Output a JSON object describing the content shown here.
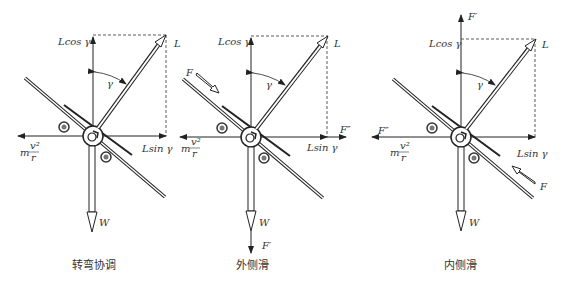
{
  "panels": [
    {
      "caption": "转弯协调",
      "labels": {
        "lcos": "Lcos γ",
        "l": "L",
        "gamma": "γ",
        "lsin": "Lsin γ",
        "mv_m": "m",
        "mv_num": "v²",
        "mv_den": "r",
        "w": "W"
      }
    },
    {
      "caption": "外侧滑",
      "labels": {
        "lcos": "Lcos γ",
        "l": "L",
        "gamma": "γ",
        "lsin": "Lsin γ",
        "mv_m": "m",
        "mv_num": "v²",
        "mv_den": "r",
        "w": "W",
        "f": "F",
        "f2": "F″",
        "f1": "F′"
      }
    },
    {
      "caption": "内侧滑",
      "labels": {
        "lcos": "Lcos γ",
        "l": "L",
        "gamma": "γ",
        "lsin": "Lsin γ",
        "mv_m": "m",
        "mv_num": "v²",
        "mv_den": "r",
        "w": "W",
        "f": "F",
        "f2": "F″",
        "f1": "F′"
      }
    }
  ]
}
